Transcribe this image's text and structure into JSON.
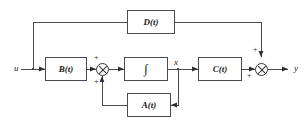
{
  "diagram": {
    "type": "control-system-block-diagram",
    "line_color": "#4a4a4a",
    "text_color": "#1a1a1a",
    "background": "#ffffff",
    "blocks": [
      {
        "id": "D",
        "label": "D(t)",
        "x": 127,
        "y": 10,
        "w": 48,
        "h": 24
      },
      {
        "id": "B",
        "label": "B(t)",
        "x": 45,
        "y": 57,
        "w": 42,
        "h": 24
      },
      {
        "id": "INT",
        "label": "∫",
        "x": 124,
        "y": 57,
        "w": 44,
        "h": 24
      },
      {
        "id": "C",
        "label": "C(t)",
        "x": 198,
        "y": 57,
        "w": 44,
        "h": 24
      },
      {
        "id": "A",
        "label": "A(t)",
        "x": 127,
        "y": 93,
        "w": 44,
        "h": 24
      }
    ],
    "summers": [
      {
        "id": "sum1",
        "x": 96,
        "y": 63
      },
      {
        "id": "sum2",
        "x": 255,
        "y": 63
      }
    ],
    "signs": [
      {
        "id": "sum1-plus-top",
        "label": "+",
        "x": 94,
        "y": 54
      },
      {
        "id": "sum1-plus-bottom",
        "label": "+",
        "x": 94,
        "y": 78
      },
      {
        "id": "sum2-plus-top",
        "label": "+",
        "x": 253,
        "y": 46
      },
      {
        "id": "sum2-plus-bottom",
        "label": "+",
        "x": 247,
        "y": 72
      }
    ],
    "signals": [
      {
        "id": "input-u",
        "label": "u",
        "x": 14,
        "y": 64
      },
      {
        "id": "state-x",
        "label": "x",
        "x": 174,
        "y": 58
      },
      {
        "id": "output-y",
        "label": "y",
        "x": 294,
        "y": 64
      }
    ]
  }
}
